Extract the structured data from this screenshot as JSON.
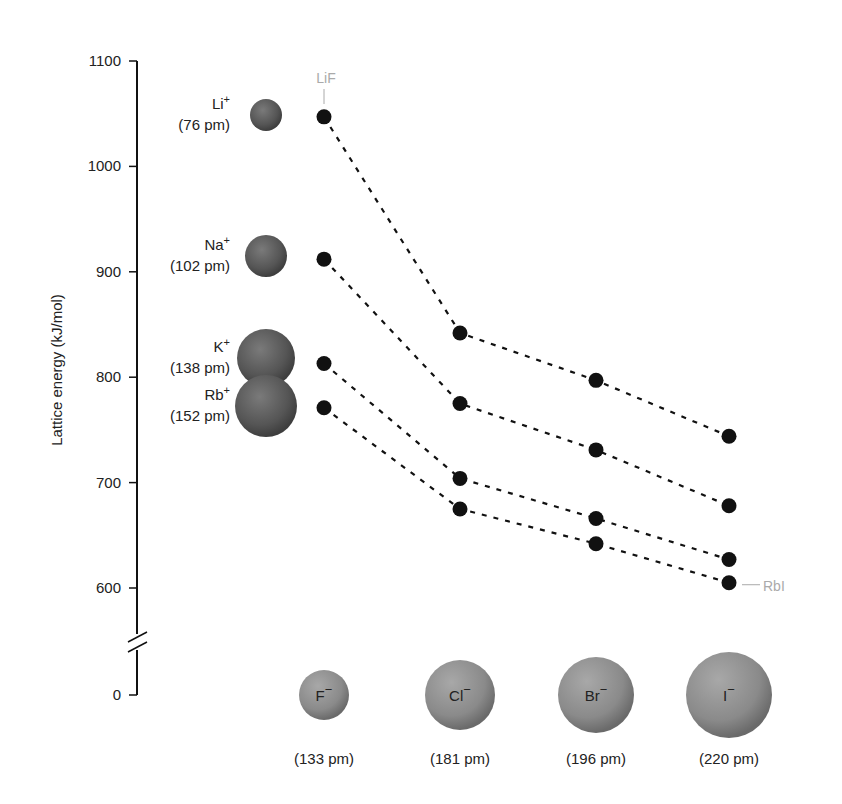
{
  "chart_data": {
    "type": "line",
    "title": "",
    "xlabel": "",
    "ylabel": "Lattice energy (kJ/mol)",
    "ylim": [
      0,
      1100
    ],
    "axis_break": [
      560,
      600
    ],
    "yticks": [
      0,
      600,
      700,
      800,
      900,
      1000,
      1100
    ],
    "grid": false,
    "legend": "none",
    "categories": [
      "F−",
      "Cl−",
      "Br−",
      "I−"
    ],
    "anions": [
      {
        "symbol": "F",
        "charge": "−",
        "radius_label": "(133 pm)",
        "radius": 133
      },
      {
        "symbol": "Cl",
        "charge": "−",
        "radius_label": "(181 pm)",
        "radius": 181
      },
      {
        "symbol": "Br",
        "charge": "−",
        "radius_label": "(196 pm)",
        "radius": 196
      },
      {
        "symbol": "I",
        "charge": "−",
        "radius_label": "(220 pm)",
        "radius": 220
      }
    ],
    "series": [
      {
        "name": "Li+",
        "symbol": "Li",
        "charge": "+",
        "radius_label": "(76 pm)",
        "radius": 76,
        "values": [
          1047,
          842,
          797,
          744
        ]
      },
      {
        "name": "Na+",
        "symbol": "Na",
        "charge": "+",
        "radius_label": "(102 pm)",
        "radius": 102,
        "values": [
          912,
          775,
          731,
          678
        ]
      },
      {
        "name": "K+",
        "symbol": "K",
        "charge": "+",
        "radius_label": "(138 pm)",
        "radius": 138,
        "values": [
          813,
          704,
          666,
          627
        ]
      },
      {
        "name": "Rb+",
        "symbol": "Rb",
        "charge": "+",
        "radius_label": "(152 pm)",
        "radius": 152,
        "values": [
          771,
          675,
          642,
          605
        ]
      }
    ],
    "annotations": [
      {
        "text": "LiF",
        "series": "Li+",
        "category": "F−"
      },
      {
        "text": "RbI",
        "series": "Rb+",
        "category": "I−"
      }
    ]
  },
  "colors": {
    "point": "#111111",
    "sphere": "#6e6e6e",
    "callout": "#aaaaaa"
  }
}
